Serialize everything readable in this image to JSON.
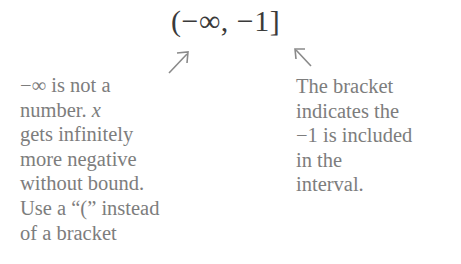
{
  "title": {
    "interval": "(−∞, −1]"
  },
  "annotations": {
    "left": {
      "points_to": "open-parenthesis",
      "arrow_icon": "arrow-up-right-icon",
      "lines": [
        "−∞ is not a",
        "number. ",
        "gets infinitely",
        "more negative",
        "without bound.",
        "Use a “(” instead",
        "of a bracket"
      ],
      "variable": "x"
    },
    "right": {
      "points_to": "closing-bracket",
      "arrow_icon": "arrow-up-left-icon",
      "lines": [
        "The bracket",
        "indicates the",
        "−1 is included",
        "in the",
        "interval."
      ]
    }
  },
  "colors": {
    "title": "#3a3a3a",
    "annotation_text": "#7d7d7d",
    "arrow": "#8a8a8a",
    "background": "#ffffff"
  }
}
